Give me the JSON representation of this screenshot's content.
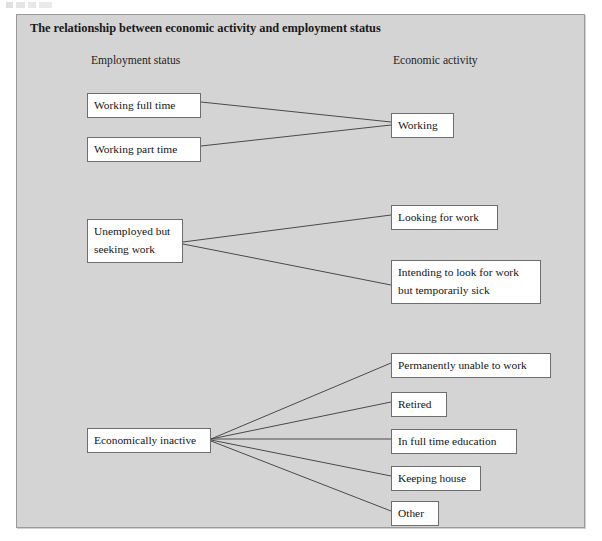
{
  "figure": {
    "title": "The relationship between economic activity and employment status",
    "background_color": "#d4d4d4",
    "node_fill": "#ffffff",
    "node_border": "#6e6e6e",
    "edge_color": "#4a4a4a"
  },
  "columns": {
    "left_header": "Employment status",
    "right_header": "Economic activity"
  },
  "employment_status": [
    {
      "id": "working-full-time",
      "label": "Working full time"
    },
    {
      "id": "working-part-time",
      "label": "Working part time"
    },
    {
      "id": "unemployed-seeking",
      "label": "Unemployed but",
      "label_line2": "seeking work"
    },
    {
      "id": "economically-inactive",
      "label": "Economically inactive"
    }
  ],
  "economic_activity": [
    {
      "id": "working",
      "label": "Working"
    },
    {
      "id": "looking-for-work",
      "label": "Looking for work"
    },
    {
      "id": "intending-temporarily-sick",
      "label": "Intending to look for work",
      "label_line2": "but temporarily sick"
    },
    {
      "id": "permanently-unable",
      "label": "Permanently unable to work"
    },
    {
      "id": "retired",
      "label": "Retired"
    },
    {
      "id": "full-time-education",
      "label": "In full time education"
    },
    {
      "id": "keeping-house",
      "label": "Keeping house"
    },
    {
      "id": "other",
      "label": "Other"
    }
  ],
  "relationships": [
    {
      "from": "working-full-time",
      "to": "working"
    },
    {
      "from": "working-part-time",
      "to": "working"
    },
    {
      "from": "unemployed-seeking",
      "to": "looking-for-work"
    },
    {
      "from": "unemployed-seeking",
      "to": "intending-temporarily-sick"
    },
    {
      "from": "economically-inactive",
      "to": "permanently-unable"
    },
    {
      "from": "economically-inactive",
      "to": "retired"
    },
    {
      "from": "economically-inactive",
      "to": "full-time-education"
    },
    {
      "from": "economically-inactive",
      "to": "keeping-house"
    },
    {
      "from": "economically-inactive",
      "to": "other"
    }
  ]
}
